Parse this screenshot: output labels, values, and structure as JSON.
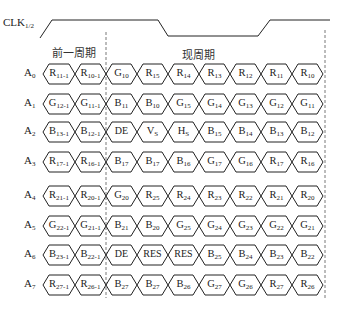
{
  "clock": {
    "label": "CLK",
    "sub": "1/2"
  },
  "periods": {
    "previous": "前一周期",
    "current": "现周期"
  },
  "rows": [
    {
      "name": "A",
      "sub": "0",
      "cells": [
        [
          "R",
          "11-1"
        ],
        [
          "R",
          "10-1"
        ],
        [
          "G",
          "10"
        ],
        [
          "R",
          "15"
        ],
        [
          "R",
          "14"
        ],
        [
          "R",
          "13"
        ],
        [
          "R",
          "12"
        ],
        [
          "R",
          "11"
        ],
        [
          "R",
          "10"
        ]
      ]
    },
    {
      "name": "A",
      "sub": "1",
      "cells": [
        [
          "G",
          "12-1"
        ],
        [
          "G",
          "11-1"
        ],
        [
          "B",
          "11"
        ],
        [
          "B",
          "10"
        ],
        [
          "G",
          "15"
        ],
        [
          "G",
          "14"
        ],
        [
          "G",
          "13"
        ],
        [
          "G",
          "12"
        ],
        [
          "G",
          "11"
        ]
      ]
    },
    {
      "name": "A",
      "sub": "2",
      "cells": [
        [
          "B",
          "13-1"
        ],
        [
          "B",
          "12-1"
        ],
        [
          "DE",
          ""
        ],
        [
          "V",
          "S"
        ],
        [
          "H",
          "S"
        ],
        [
          "B",
          "15"
        ],
        [
          "B",
          "14"
        ],
        [
          "B",
          "13"
        ],
        [
          "B",
          "12"
        ]
      ]
    },
    {
      "name": "A",
      "sub": "3",
      "cells": [
        [
          "R",
          "17-1"
        ],
        [
          "R",
          "16-1"
        ],
        [
          "B",
          "17"
        ],
        [
          "B",
          "17"
        ],
        [
          "B",
          "16"
        ],
        [
          "G",
          "17"
        ],
        [
          "G",
          "16"
        ],
        [
          "R",
          "17"
        ],
        [
          "R",
          "16"
        ]
      ]
    },
    {
      "name": "A",
      "sub": "4",
      "cells": [
        [
          "R",
          "21-1"
        ],
        [
          "R",
          "20-1"
        ],
        [
          "G",
          "20"
        ],
        [
          "R",
          "25"
        ],
        [
          "R",
          "24"
        ],
        [
          "R",
          "23"
        ],
        [
          "R",
          "22"
        ],
        [
          "R",
          "21"
        ],
        [
          "R",
          "20"
        ]
      ]
    },
    {
      "name": "A",
      "sub": "5",
      "cells": [
        [
          "G",
          "22-1"
        ],
        [
          "G",
          "21-1"
        ],
        [
          "B",
          "21"
        ],
        [
          "B",
          "20"
        ],
        [
          "G",
          "25"
        ],
        [
          "G",
          "24"
        ],
        [
          "G",
          "23"
        ],
        [
          "G",
          "22"
        ],
        [
          "G",
          "21"
        ]
      ]
    },
    {
      "name": "A",
      "sub": "6",
      "cells": [
        [
          "B",
          "23-1"
        ],
        [
          "B",
          "22-1"
        ],
        [
          "DE",
          ""
        ],
        [
          "RES",
          ""
        ],
        [
          "RES",
          ""
        ],
        [
          "B",
          "25"
        ],
        [
          "B",
          "24"
        ],
        [
          "B",
          "23"
        ],
        [
          "B",
          "22"
        ]
      ]
    },
    {
      "name": "A",
      "sub": "7",
      "cells": [
        [
          "R",
          "27-1"
        ],
        [
          "R",
          "26-1"
        ],
        [
          "B",
          "27"
        ],
        [
          "B",
          "27"
        ],
        [
          "B",
          "26"
        ],
        [
          "G",
          "27"
        ],
        [
          "G",
          "26"
        ],
        [
          "R",
          "27"
        ],
        [
          "R",
          "26"
        ]
      ]
    }
  ],
  "layout": {
    "row_y": [
      74,
      104,
      132,
      162,
      196,
      226,
      255,
      285
    ],
    "cell_edges": [
      43,
      75,
      106,
      137,
      168,
      199,
      230,
      261,
      292,
      323
    ],
    "dash_x": [
      106,
      325
    ]
  },
  "colors": {
    "line": "#222222",
    "dash": "#555555"
  }
}
